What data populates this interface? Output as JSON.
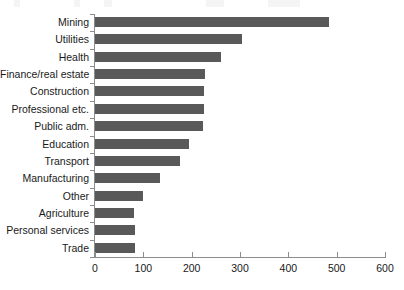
{
  "chart_data": {
    "type": "bar",
    "orientation": "horizontal",
    "title": "",
    "xlabel": "",
    "ylabel": "",
    "xlim": [
      0,
      600
    ],
    "xticks": [
      0,
      100,
      200,
      300,
      400,
      500,
      600
    ],
    "grid": false,
    "legend": null,
    "bar_color": "#595959",
    "axis_color": "#8c8c8c",
    "categories": [
      "Mining",
      "Utilities",
      "Health",
      "Finance/real estate",
      "Construction",
      "Professional etc.",
      "Public adm.",
      "Education",
      "Transport",
      "Manufacturing",
      "Other",
      "Agriculture",
      "Personal services",
      "Trade"
    ],
    "values": [
      485,
      305,
      260,
      227,
      226,
      225,
      224,
      195,
      175,
      135,
      100,
      80,
      83,
      83
    ]
  }
}
